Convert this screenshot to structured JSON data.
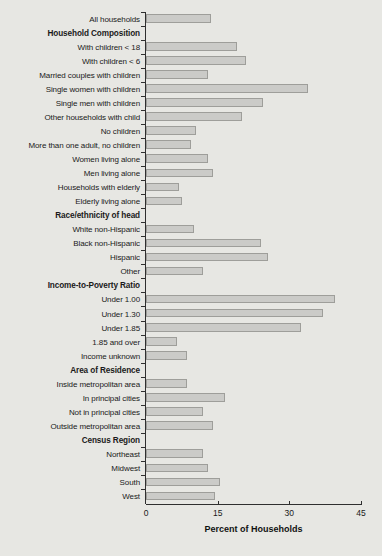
{
  "chart_data": {
    "type": "bar",
    "orientation": "horizontal",
    "title": "",
    "xlabel": "Percent of Households",
    "ylabel": "",
    "xlim": [
      0,
      45
    ],
    "x_ticks": [
      0,
      15,
      30,
      45
    ],
    "grid": false,
    "legend": "none",
    "rows": [
      {
        "label": "All households",
        "value": 13.5
      },
      {
        "label": "Household Composition",
        "header": true
      },
      {
        "label": "With children < 18",
        "value": 19
      },
      {
        "label": "With children < 6",
        "value": 21
      },
      {
        "label": "Married couples with children",
        "value": 13
      },
      {
        "label": "Single women with children",
        "value": 34
      },
      {
        "label": "Single men with children",
        "value": 24.5
      },
      {
        "label": "Other households with child",
        "value": 20
      },
      {
        "label": "No children",
        "value": 10.5
      },
      {
        "label": "More than one adult, no children",
        "value": 9.5
      },
      {
        "label": "Women living alone",
        "value": 13
      },
      {
        "label": "Men living alone",
        "value": 14
      },
      {
        "label": "Households with elderly",
        "value": 7
      },
      {
        "label": "Elderly living alone",
        "value": 7.5
      },
      {
        "label": "Race/ethnicity of head",
        "header": true
      },
      {
        "label": "White non-Hispanic",
        "value": 10
      },
      {
        "label": "Black non-Hispanic",
        "value": 24
      },
      {
        "label": "Hispanic",
        "value": 25.5
      },
      {
        "label": "Other",
        "value": 12
      },
      {
        "label": "Income-to-Poverty Ratio",
        "header": true
      },
      {
        "label": "Under 1.00",
        "value": 39.5
      },
      {
        "label": "Under 1.30",
        "value": 37
      },
      {
        "label": "Under 1.85",
        "value": 32.5
      },
      {
        "label": "1.85 and over",
        "value": 6.5
      },
      {
        "label": "Income unknown",
        "value": 8.5
      },
      {
        "label": "Area of Residence",
        "header": true
      },
      {
        "label": "Inside metropolitan area",
        "value": 8.5
      },
      {
        "label": "In principal cities",
        "value": 16.5
      },
      {
        "label": "Not in principal cities",
        "value": 12
      },
      {
        "label": "Outside metropolitan area",
        "value": 14
      },
      {
        "label": "Census Region",
        "header": true
      },
      {
        "label": "Northeast",
        "value": 12
      },
      {
        "label": "Midwest",
        "value": 13
      },
      {
        "label": "South",
        "value": 15.5
      },
      {
        "label": "West",
        "value": 14.5
      }
    ],
    "colors": {
      "background": "#e7e7e3",
      "bar_fill": "#cbcbc8",
      "bar_border": "#9e9e9a",
      "axis": "#2f2f2f",
      "text": "#1a1a1a"
    }
  }
}
